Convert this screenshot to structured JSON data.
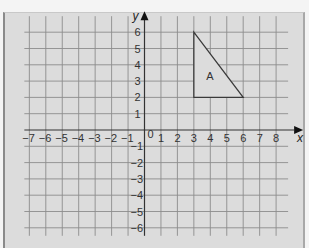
{
  "diagram": {
    "type": "coordinate-grid",
    "x_axis": {
      "label": "x",
      "min": -7,
      "max": 8,
      "ticks": [
        -7,
        -6,
        -5,
        -4,
        -3,
        -2,
        -1,
        1,
        2,
        3,
        4,
        5,
        6,
        7,
        8
      ]
    },
    "y_axis": {
      "label": "y",
      "min": -6,
      "max": 6,
      "ticks": [
        6,
        5,
        4,
        3,
        2,
        1,
        -1,
        -2,
        -3,
        -4,
        -5,
        -6
      ]
    },
    "origin_label": "0",
    "shapes": [
      {
        "name": "A",
        "type": "triangle",
        "vertices": [
          [
            3,
            6
          ],
          [
            3,
            2
          ],
          [
            6,
            2
          ]
        ]
      }
    ],
    "colors": {
      "background": "#dcdcdc",
      "grid": "#8c8c8c",
      "axis": "#333333",
      "shape": "#3a3a3a"
    }
  }
}
